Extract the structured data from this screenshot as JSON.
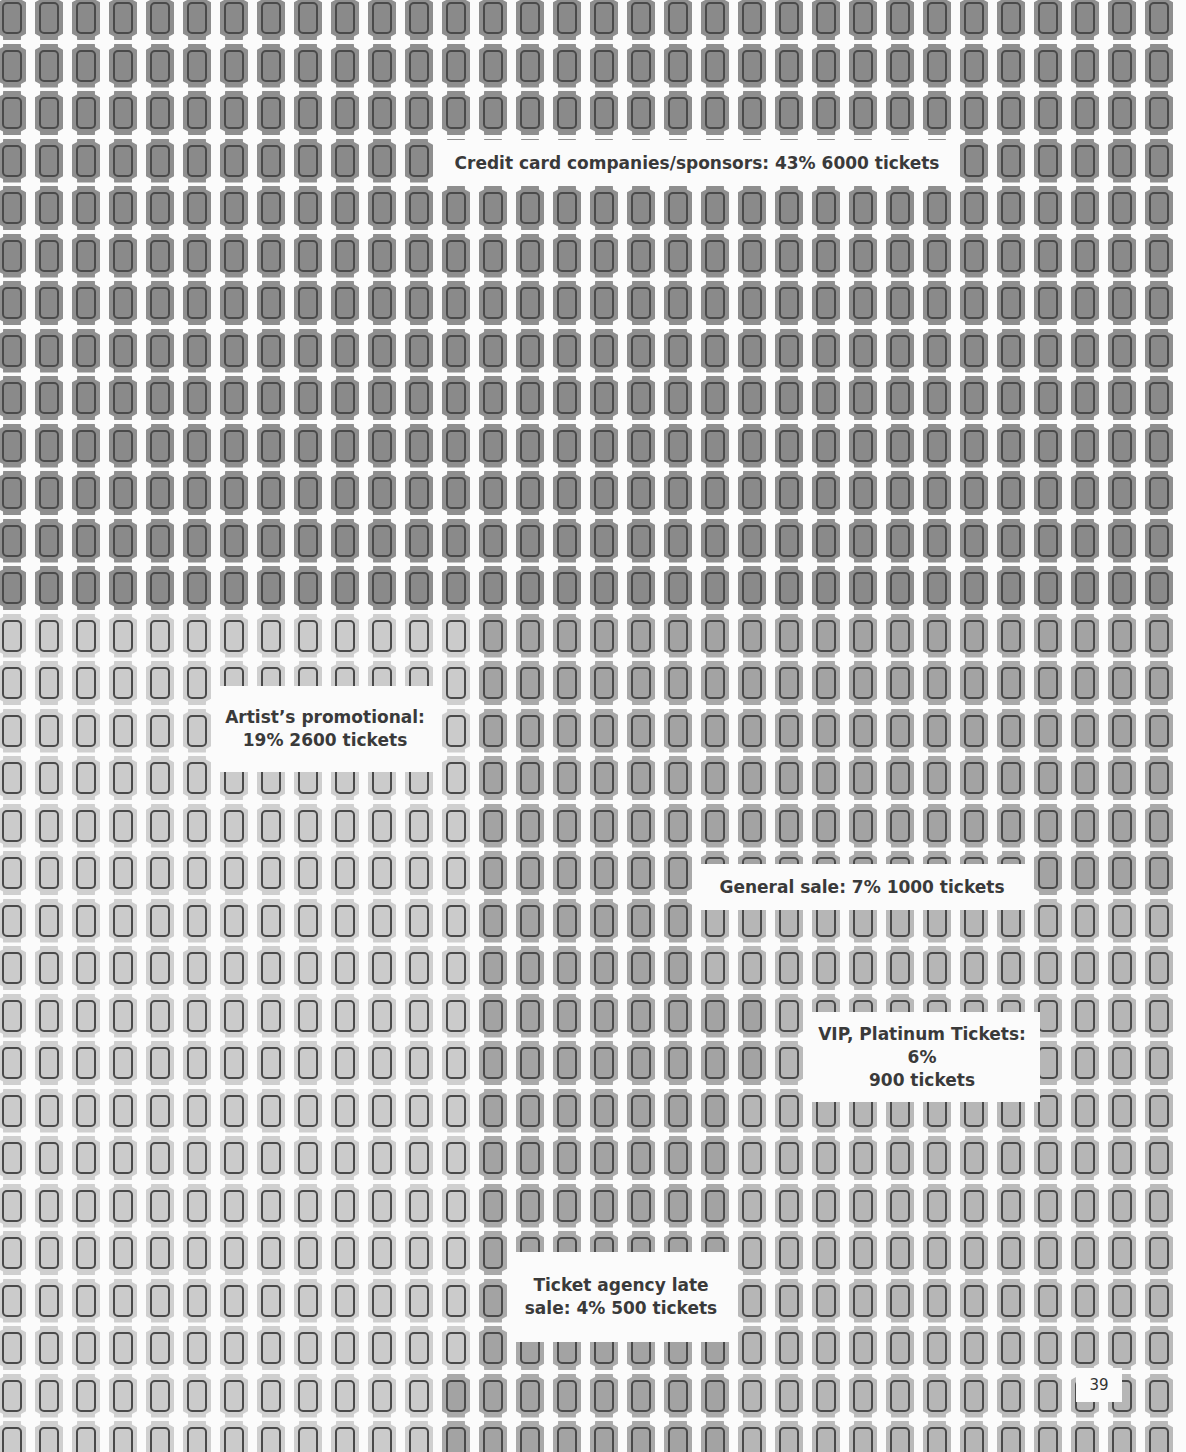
{
  "page_number": "39",
  "labels": {
    "credit_card": "Credit card companies/sponsors: 43% 6000 tickets",
    "artist_line1": "Artist’s promotional:",
    "artist_line2": "19% 2600 tickets",
    "general_sale": "General sale: 7% 1000 tickets",
    "vip_line1": "VIP, Platinum Tickets: 6%",
    "vip_line2": "900 tickets",
    "agency_line1": "Ticket agency late",
    "agency_line2": "sale: 4% 500 tickets"
  },
  "colors": {
    "background": "#fbfbfb",
    "dark": "#8a8a8a",
    "medium": "#a3a3a3",
    "mid": "#b6b6b6",
    "light": "#cbcbcb",
    "outline": "#4a4a4a",
    "text": "#3a3a3a"
  },
  "grid": {
    "columns": 32,
    "rows": 31,
    "col_pitch": 37,
    "row_pitch": 47.5,
    "x0": -2,
    "y0": -4
  },
  "chart_data": {
    "type": "pictogram",
    "title": "",
    "unit": "tickets (each icon represents a block of tickets)",
    "categories": [
      "Credit card companies/sponsors",
      "Artist’s promotional",
      "General sale",
      "VIP, Platinum Tickets",
      "Ticket agency late sale"
    ],
    "series": [
      {
        "name": "Percent",
        "values": [
          43,
          19,
          7,
          6,
          4
        ]
      },
      {
        "name": "Tickets",
        "values": [
          6000,
          2600,
          1000,
          900,
          500
        ]
      }
    ],
    "legend": "none (labels placed inside grid regions)",
    "grid": false
  }
}
